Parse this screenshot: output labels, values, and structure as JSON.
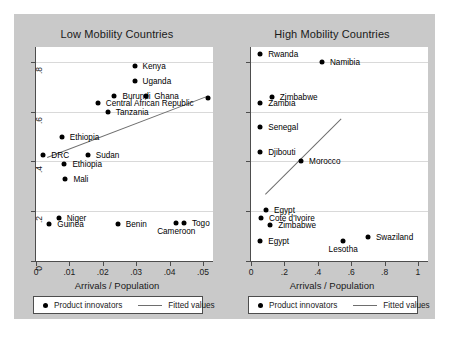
{
  "figure": {
    "background_color": "#c9c9c9",
    "plot_background_color": "#ffffff",
    "point_color": "#000000",
    "fit_line_color": "#6e6e6e"
  },
  "legend": {
    "points_label": "Product innovators",
    "line_label": "Fitted values"
  },
  "chart_data": [
    {
      "type": "scatter",
      "title": "Low Mobility Countries",
      "xlabel": "Arrivals / Population",
      "ylabel": "",
      "xlim": [
        0,
        0.053
      ],
      "ylim": [
        0,
        0.86
      ],
      "xticks": [
        0,
        0.01,
        0.02,
        0.03,
        0.04,
        0.05
      ],
      "xticklabels": [
        "0",
        ".01",
        ".02",
        ".03",
        ".04",
        ".05"
      ],
      "yticks": [
        0,
        0.2,
        0.4,
        0.6,
        0.8
      ],
      "yticklabels": [
        "0",
        ".2",
        ".4",
        ".6",
        ".8"
      ],
      "grid": true,
      "legend_position": "below",
      "series": [
        {
          "name": "Product innovators",
          "points": [
            {
              "label": "Kenya",
              "x": 0.0295,
              "y": 0.785,
              "label_pos": "right"
            },
            {
              "label": "Uganda",
              "x": 0.0295,
              "y": 0.725,
              "label_pos": "right"
            },
            {
              "label": "Burundi",
              "x": 0.0235,
              "y": 0.665,
              "label_pos": "right"
            },
            {
              "label": "Ghana",
              "x": 0.033,
              "y": 0.665,
              "label_pos": "right"
            },
            {
              "label": "Malawi",
              "x": 0.0515,
              "y": 0.655,
              "label_pos": "right"
            },
            {
              "label": "Central African Republic",
              "x": 0.0185,
              "y": 0.635,
              "label_pos": "right"
            },
            {
              "label": "Tanzania",
              "x": 0.0215,
              "y": 0.6,
              "label_pos": "right"
            },
            {
              "label": "Ethiopia",
              "x": 0.0077,
              "y": 0.5,
              "label_pos": "right"
            },
            {
              "label": "DRC",
              "x": 0.0022,
              "y": 0.425,
              "label_pos": "right"
            },
            {
              "label": "Sudan",
              "x": 0.0155,
              "y": 0.425,
              "label_pos": "right"
            },
            {
              "label": "Ethiopia",
              "x": 0.0085,
              "y": 0.39,
              "label_pos": "right"
            },
            {
              "label": "Mali",
              "x": 0.0088,
              "y": 0.33,
              "label_pos": "right"
            },
            {
              "label": "Niger",
              "x": 0.0068,
              "y": 0.172,
              "label_pos": "right"
            },
            {
              "label": "Guinea",
              "x": 0.004,
              "y": 0.148,
              "label_pos": "right"
            },
            {
              "label": "Benin",
              "x": 0.0245,
              "y": 0.148,
              "label_pos": "right"
            },
            {
              "label": "Cameroon",
              "x": 0.042,
              "y": 0.152,
              "label_pos": "below"
            },
            {
              "label": "Togo",
              "x": 0.0443,
              "y": 0.152,
              "label_pos": "right"
            }
          ]
        }
      ],
      "fit_line": {
        "x0": 0.0033,
        "y0": 0.418,
        "x1": 0.0515,
        "y1": 0.665
      }
    },
    {
      "type": "scatter",
      "title": "High Mobility Countries",
      "xlabel": "Arrivals / Population",
      "ylabel": "",
      "xlim": [
        0,
        1.06
      ],
      "ylim": [
        0,
        0.86
      ],
      "xticks": [
        0,
        0.2,
        0.4,
        0.6,
        0.8,
        1
      ],
      "xticklabels": [
        "0",
        ".2",
        ".4",
        ".6",
        ".8",
        "1"
      ],
      "yticks": [
        0,
        0.2,
        0.4,
        0.6,
        0.8
      ],
      "yticklabels": [
        "0",
        ".2",
        ".4",
        ".6",
        ".8"
      ],
      "grid": true,
      "legend_position": "below",
      "series": [
        {
          "name": "Product innovators",
          "points": [
            {
              "label": "Rwanda",
              "x": 0.055,
              "y": 0.83,
              "label_pos": "right"
            },
            {
              "label": "Namibia",
              "x": 0.425,
              "y": 0.8,
              "label_pos": "right"
            },
            {
              "label": "Zimbabwe",
              "x": 0.125,
              "y": 0.66,
              "label_pos": "right"
            },
            {
              "label": "Zambia",
              "x": 0.055,
              "y": 0.635,
              "label_pos": "right"
            },
            {
              "label": "Senegal",
              "x": 0.055,
              "y": 0.54,
              "label_pos": "right"
            },
            {
              "label": "Djibouti",
              "x": 0.055,
              "y": 0.44,
              "label_pos": "right"
            },
            {
              "label": "Morocco",
              "x": 0.3,
              "y": 0.4,
              "label_pos": "right"
            },
            {
              "label": "Egypt",
              "x": 0.09,
              "y": 0.205,
              "label_pos": "right"
            },
            {
              "label": "Cote d'Ivoire",
              "x": 0.06,
              "y": 0.172,
              "label_pos": "right"
            },
            {
              "label": "Zimbabwe",
              "x": 0.115,
              "y": 0.145,
              "label_pos": "right"
            },
            {
              "label": "Egypt",
              "x": 0.055,
              "y": 0.082,
              "label_pos": "right"
            },
            {
              "label": "Lesotha",
              "x": 0.552,
              "y": 0.082,
              "label_pos": "below"
            },
            {
              "label": "Swaziland",
              "x": 0.7,
              "y": 0.095,
              "label_pos": "right"
            }
          ]
        }
      ],
      "fit_line": {
        "x0": 0.085,
        "y0": 0.268,
        "x1": 0.54,
        "y1": 0.572
      }
    }
  ]
}
